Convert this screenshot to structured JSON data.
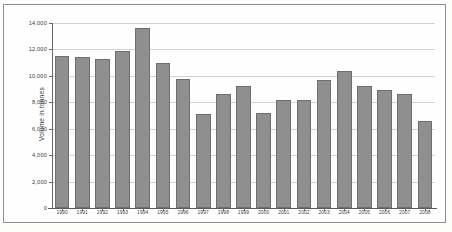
{
  "chart_data": {
    "type": "bar",
    "title": "",
    "subtitle": "",
    "xlabel": "",
    "ylabel": "Volume in tonnes",
    "ylim": [
      0,
      14000
    ],
    "ytick_values": [
      0,
      2000,
      4000,
      6000,
      8000,
      10000,
      12000,
      14000
    ],
    "ytick_labels": [
      "0",
      "2,000",
      "4,000",
      "6,000",
      "8,000",
      "10,000",
      "12,000",
      "14,000"
    ],
    "grid": true,
    "legend": null,
    "legend_position": "none",
    "bar_color": "#8f8f8f",
    "bar_border_color": "#6e6e6e",
    "gridline_color": "#d2d2d2",
    "axis_color": "#6a6a6a",
    "categories": [
      "1990",
      "1991",
      "1992",
      "1993",
      "1994",
      "1995",
      "1996",
      "1997",
      "1998",
      "1999",
      "2000",
      "2001",
      "2002",
      "2003",
      "2004",
      "2005",
      "2006",
      "2007",
      "2008"
    ],
    "values": [
      11500,
      11400,
      11300,
      11900,
      13600,
      10950,
      9800,
      7150,
      8650,
      9200,
      7200,
      8200,
      8150,
      9650,
      10350,
      9250,
      8950,
      8650,
      6600
    ],
    "series": [
      {
        "name": "Volume in tonnes",
        "values": [
          11500,
          11400,
          11300,
          11900,
          13600,
          10950,
          9800,
          7150,
          8650,
          9200,
          7200,
          8200,
          8150,
          9650,
          10350,
          9250,
          8950,
          8650,
          6600
        ]
      }
    ]
  }
}
